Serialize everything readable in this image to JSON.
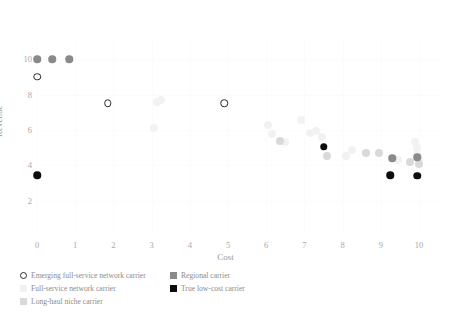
{
  "chart_data": {
    "type": "scatter",
    "title": "",
    "xlabel": "Cost",
    "ylabel": "Revenue",
    "xlim": [
      0,
      10.6
    ],
    "ylim": [
      0,
      11.2
    ],
    "xticks": [
      "0",
      "1",
      "2",
      "3",
      "4",
      "5",
      "6",
      "7",
      "8",
      "9",
      "10"
    ],
    "xtick_values": [
      0,
      1,
      2,
      3,
      4,
      5,
      6,
      7,
      8,
      9,
      10
    ],
    "yticks": [
      "2",
      "4",
      "6",
      "8",
      "10"
    ],
    "ytick_values": [
      2,
      4,
      6,
      8,
      10
    ],
    "grid": true,
    "legend_position": "below-left",
    "series": [
      {
        "name": "Emerging full-service network carrier",
        "marker": "open-circle",
        "color": "#2b2b2b",
        "points": [
          {
            "x": 0.0,
            "y": 9.0
          },
          {
            "x": 1.85,
            "y": 7.5
          },
          {
            "x": 4.9,
            "y": 7.5
          }
        ]
      },
      {
        "name": "Full-service network carrier",
        "marker": "filled-circle",
        "color": "#f2f2f2",
        "points": [
          {
            "x": 3.15,
            "y": 7.6
          },
          {
            "x": 3.25,
            "y": 7.7
          },
          {
            "x": 3.05,
            "y": 6.1
          },
          {
            "x": 6.05,
            "y": 6.3
          },
          {
            "x": 6.15,
            "y": 5.75
          },
          {
            "x": 6.5,
            "y": 5.3
          },
          {
            "x": 6.9,
            "y": 6.55
          },
          {
            "x": 7.15,
            "y": 5.85
          },
          {
            "x": 7.3,
            "y": 5.95
          },
          {
            "x": 7.45,
            "y": 5.6
          },
          {
            "x": 7.5,
            "y": 5.05
          },
          {
            "x": 8.1,
            "y": 4.5
          },
          {
            "x": 8.25,
            "y": 4.85
          },
          {
            "x": 9.45,
            "y": 4.3
          },
          {
            "x": 9.9,
            "y": 5.3
          },
          {
            "x": 9.95,
            "y": 4.95
          },
          {
            "x": 9.95,
            "y": 4.6
          },
          {
            "x": 10.0,
            "y": 4.35
          }
        ]
      },
      {
        "name": "Long-haul niche carrier",
        "marker": "filled-circle",
        "color": "#d9d9d9",
        "points": [
          {
            "x": 6.35,
            "y": 5.35
          },
          {
            "x": 7.6,
            "y": 4.55
          },
          {
            "x": 8.6,
            "y": 4.7
          },
          {
            "x": 8.95,
            "y": 4.7
          },
          {
            "x": 9.75,
            "y": 4.2
          },
          {
            "x": 10.0,
            "y": 4.1
          }
        ]
      },
      {
        "name": "Regional carrier",
        "marker": "filled-circle",
        "color": "#8a8a8a",
        "points": [
          {
            "x": 0.4,
            "y": 10.0
          },
          {
            "x": 0.85,
            "y": 10.0
          },
          {
            "x": 0.0,
            "y": 10.0
          },
          {
            "x": 9.3,
            "y": 4.4
          },
          {
            "x": 9.95,
            "y": 4.45
          }
        ]
      },
      {
        "name": "True low-cost carrier",
        "marker": "filled-circle",
        "color": "#0d0d0d",
        "points": [
          {
            "x": 0.0,
            "y": 3.45
          },
          {
            "x": 7.5,
            "y": 5.05
          },
          {
            "x": 9.25,
            "y": 3.45
          },
          {
            "x": 9.95,
            "y": 3.4
          }
        ]
      }
    ]
  },
  "legend": {
    "left_column": [
      {
        "label": "Emerging full-service network carrier",
        "swatch": "circle"
      },
      {
        "label": "Full-service network carrier",
        "swatch": "sq-full"
      },
      {
        "label": "Long-haul niche carrier",
        "swatch": "sq-longhaul"
      }
    ],
    "right_column": [
      {
        "label": "Regional carrier",
        "swatch": "sq-regional"
      },
      {
        "label": "True low-cost carrier",
        "swatch": "sq-lowcost"
      }
    ]
  }
}
